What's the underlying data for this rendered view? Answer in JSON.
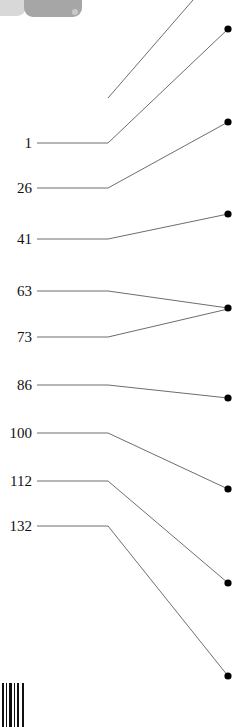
{
  "figure": {
    "kind": "leader-line-callout-diagram",
    "width": 249,
    "height": 727,
    "background_color": "#ffffff",
    "line_color": "#6d6d6d",
    "dot_color": "#000000",
    "label_color": "#111111",
    "elbow_x": 108,
    "terminal_x": 230,
    "label_line_start_x": 37
  },
  "top_artifact": {
    "name": "cropped-grey-icon",
    "color": "#a6a6a6",
    "secondary_color": "#d8d8d8"
  },
  "barcode": {
    "name": "cropped-barcode",
    "color": "#111111",
    "bars": [
      {
        "x": 0,
        "w": 2
      },
      {
        "x": 4,
        "w": 1
      },
      {
        "x": 7,
        "w": 3
      },
      {
        "x": 12,
        "w": 1
      },
      {
        "x": 15,
        "w": 2
      },
      {
        "x": 20,
        "w": 2
      }
    ]
  },
  "callouts": [
    {
      "label": "1",
      "label_x": 14,
      "label_y": 136,
      "line_start_x": 37,
      "line_start_y": 143,
      "elbow_x": 108,
      "elbow_y": 143,
      "end_x": 228,
      "end_y": 29,
      "has_dot": true
    },
    {
      "label": "26",
      "label_x": 6,
      "label_y": 181,
      "line_start_x": 37,
      "line_start_y": 188,
      "elbow_x": 108,
      "elbow_y": 188,
      "end_x": 228,
      "end_y": 122,
      "has_dot": true
    },
    {
      "label": "41",
      "label_x": 8,
      "label_y": 232,
      "line_start_x": 37,
      "line_start_y": 239,
      "elbow_x": 108,
      "elbow_y": 239,
      "end_x": 228,
      "end_y": 214,
      "has_dot": true
    },
    {
      "label": "63",
      "label_x": 6,
      "label_y": 284,
      "line_start_x": 37,
      "line_start_y": 291,
      "elbow_x": 108,
      "elbow_y": 291,
      "end_x": 228,
      "end_y": 308,
      "has_dot": true
    },
    {
      "label": "73",
      "label_x": 6,
      "label_y": 330,
      "line_start_x": 37,
      "line_start_y": 337,
      "elbow_x": 108,
      "elbow_y": 337,
      "end_x": 228,
      "end_y": 309,
      "has_dot": false
    },
    {
      "label": "86",
      "label_x": 6,
      "label_y": 378,
      "line_start_x": 37,
      "line_start_y": 385,
      "elbow_x": 108,
      "elbow_y": 385,
      "end_x": 228,
      "end_y": 398,
      "has_dot": true
    },
    {
      "label": "100",
      "label_x": 0,
      "label_y": 426,
      "line_start_x": 37,
      "line_start_y": 433,
      "elbow_x": 108,
      "elbow_y": 433,
      "end_x": 228,
      "end_y": 489,
      "has_dot": true
    },
    {
      "label": "112",
      "label_x": 0,
      "label_y": 474,
      "line_start_x": 37,
      "line_start_y": 481,
      "elbow_x": 108,
      "elbow_y": 481,
      "end_x": 228,
      "end_y": 583,
      "has_dot": true
    },
    {
      "label": "132",
      "label_x": 0,
      "label_y": 519,
      "line_start_x": 37,
      "line_start_y": 526,
      "elbow_x": 108,
      "elbow_y": 526,
      "end_x": 228,
      "end_y": 676,
      "has_dot": true
    }
  ],
  "offscreen_leaders": [
    {
      "name": "leader-from-above-top-edge",
      "start_x": 193,
      "start_y": 0,
      "end_x": 108,
      "end_y": 98
    }
  ]
}
